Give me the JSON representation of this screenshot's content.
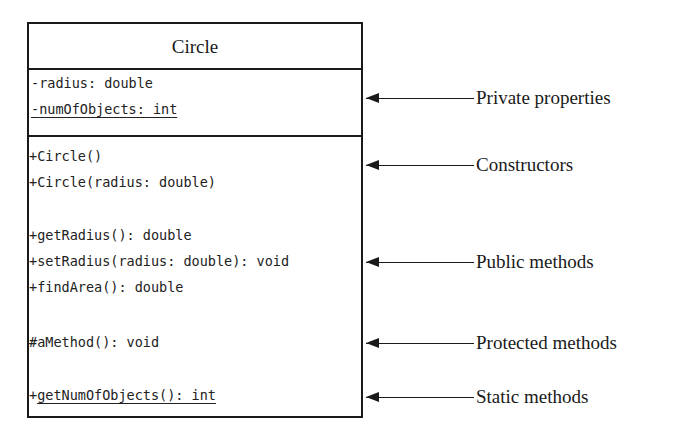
{
  "uml_class": {
    "name": "Circle",
    "attributes": [
      {
        "visibility": "-",
        "text": "radius: double",
        "static": false
      },
      {
        "visibility": "-",
        "text": "numOfObjects: int",
        "static": true
      }
    ],
    "methods": [
      {
        "visibility": "+",
        "text": "Circle()",
        "static": false,
        "group": "constructors"
      },
      {
        "visibility": "+",
        "text": "Circle(radius: double)",
        "static": false,
        "group": "constructors"
      },
      {
        "visibility": "+",
        "text": "getRadius(): double",
        "static": false,
        "group": "public"
      },
      {
        "visibility": "+",
        "text": "setRadius(radius: double): void",
        "static": false,
        "group": "public"
      },
      {
        "visibility": "+",
        "text": "findArea(): double",
        "static": false,
        "group": "public"
      },
      {
        "visibility": "#",
        "text": "aMethod(): void",
        "static": false,
        "group": "protected"
      },
      {
        "visibility": "+",
        "text": "getNumOfObjects(): int",
        "static": true,
        "group": "static"
      }
    ]
  },
  "annotations": [
    {
      "label": "Private properties"
    },
    {
      "label": "Constructors"
    },
    {
      "label": "Public methods"
    },
    {
      "label": "Protected methods"
    },
    {
      "label": "Static methods"
    }
  ],
  "colors": {
    "line": "#1a1a1a",
    "background": "#ffffff"
  }
}
